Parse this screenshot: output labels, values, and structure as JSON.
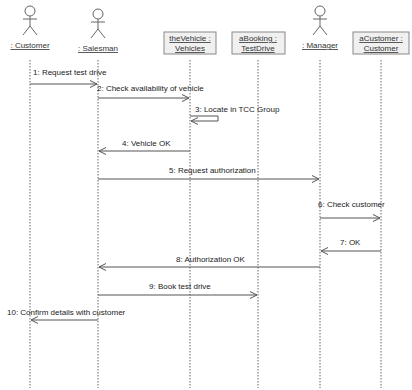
{
  "diagram": {
    "type": "UML sequence diagram",
    "participants": [
      {
        "id": "customer",
        "kind": "actor",
        "label": ": Customer",
        "x": 30
      },
      {
        "id": "salesman",
        "kind": "actor",
        "label": ": Salesman",
        "x": 98
      },
      {
        "id": "vehicle",
        "kind": "object",
        "line1": "theVehicle :",
        "line2": "Vehicles",
        "x": 190
      },
      {
        "id": "booking",
        "kind": "object",
        "line1": "aBooking :",
        "line2": "TestDrive",
        "x": 258
      },
      {
        "id": "manager",
        "kind": "actor",
        "label": ": Manager",
        "x": 320
      },
      {
        "id": "acustomer",
        "kind": "object",
        "line1": "aCustomer :",
        "line2": "Customer",
        "x": 381
      }
    ],
    "messages": [
      {
        "label": "1: Request test drive",
        "from": "customer",
        "to": "salesman",
        "y": 84,
        "type": "call"
      },
      {
        "label": "2: Check availability of vehicle",
        "from": "salesman",
        "to": "vehicle",
        "y": 98,
        "type": "call"
      },
      {
        "label": "3: Locate in TCC Group",
        "from": "vehicle",
        "to": "vehicle",
        "y": 123,
        "type": "self"
      },
      {
        "label": "4: Vehicle OK",
        "from": "vehicle",
        "to": "salesman",
        "y": 151,
        "type": "return"
      },
      {
        "label": "5: Request authorization",
        "from": "salesman",
        "to": "manager",
        "y": 179,
        "type": "call"
      },
      {
        "label": "6: Check customer",
        "from": "manager",
        "to": "acustomer",
        "y": 218,
        "type": "call"
      },
      {
        "label": "7: OK",
        "from": "acustomer",
        "to": "manager",
        "y": 251,
        "type": "return"
      },
      {
        "label": "8: Authorization OK",
        "from": "manager",
        "to": "salesman",
        "y": 267,
        "type": "return"
      },
      {
        "label": "9: Book test drive",
        "from": "salesman",
        "to": "booking",
        "y": 295,
        "type": "call"
      },
      {
        "label": "10: Confirm details with customer",
        "from": "salesman",
        "to": "customer",
        "y": 320,
        "type": "return"
      }
    ]
  },
  "colors": {
    "line": "#555555",
    "lifeline": "#666666",
    "box_fill": "#f0f0f0",
    "box_stroke": "#888888",
    "text": "#222222"
  }
}
